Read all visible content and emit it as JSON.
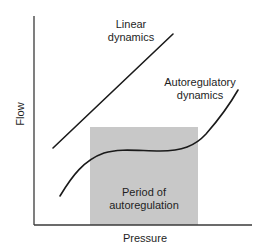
{
  "diagram": {
    "labels": {
      "linear": "Linear\ndynamics",
      "linear_line1": "Linear",
      "linear_line2": "dynamics",
      "autoregulatory_line1": "Autoregulatory",
      "autoregulatory_line2": "dynamics",
      "period_line1": "Period of",
      "period_line2": "autoregulation",
      "x_axis": "Pressure",
      "y_axis": "Flow"
    },
    "colors": {
      "line": "#1a1a1a",
      "shaded_region": "#c8c8c8",
      "background": "#ffffff",
      "axis": "#3a3a3a"
    },
    "curves": [
      {
        "name": "Linear dynamics",
        "shape": "straight line",
        "from": [
          53,
          148
        ],
        "to": [
          173,
          34
        ]
      },
      {
        "name": "Autoregulatory dynamics",
        "shape": "sigmoid with plateau",
        "from": [
          60,
          196
        ],
        "plateau_y": 151,
        "to": [
          238,
          90
        ]
      }
    ],
    "shaded_region": {
      "name": "Period of autoregulation",
      "x": [
        90,
        198
      ],
      "y": [
        127,
        225
      ]
    }
  }
}
